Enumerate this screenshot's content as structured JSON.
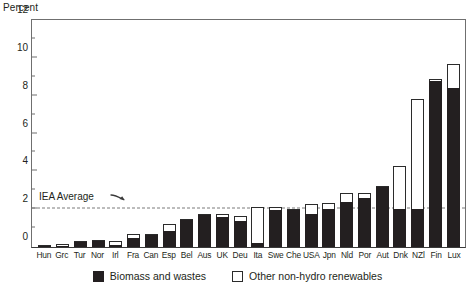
{
  "chart_data": {
    "type": "bar",
    "title": "",
    "subtitle": "",
    "ylabel": "Percent",
    "xlabel": "",
    "ylim": [
      0,
      12
    ],
    "yticks": [
      0,
      2,
      4,
      6,
      8,
      10,
      12
    ],
    "yminor": [
      1,
      3,
      5,
      7,
      9,
      11
    ],
    "grid": false,
    "stacked": true,
    "legend_position": "bottom",
    "categories": [
      "Hun",
      "Grc",
      "Tur",
      "Nor",
      "Irl",
      "Fra",
      "Can",
      "Esp",
      "Bel",
      "Aus",
      "UK",
      "Deu",
      "Ita",
      "Swe",
      "Che",
      "USA",
      "Jpn",
      "Nld",
      "Por",
      "Aut",
      "Dnk",
      "NZl",
      "Fin",
      "Lux"
    ],
    "series": [
      {
        "name": "Biomass and wastes",
        "color": "#231f20",
        "values": [
          0.05,
          0.05,
          0.25,
          0.3,
          0.1,
          0.5,
          0.65,
          0.85,
          1.45,
          1.7,
          1.6,
          1.35,
          0.2,
          1.95,
          1.95,
          1.75,
          2.0,
          2.4,
          2.6,
          3.15,
          2.0,
          2.0,
          8.8,
          8.4
        ]
      },
      {
        "name": "Other non-hydro renewables",
        "color": "#ffffff",
        "values": [
          0.05,
          0.1,
          0.05,
          0.05,
          0.2,
          0.2,
          0.05,
          0.35,
          0.05,
          0.05,
          0.15,
          0.3,
          1.9,
          0.15,
          0.05,
          0.55,
          0.35,
          0.45,
          0.25,
          0.1,
          2.3,
          5.85,
          0.1,
          1.3
        ]
      }
    ],
    "totals": [
      0.1,
      0.15,
      0.3,
      0.35,
      0.3,
      0.7,
      0.7,
      1.2,
      1.5,
      1.75,
      1.75,
      1.65,
      2.1,
      2.1,
      2.0,
      2.3,
      2.35,
      2.85,
      2.85,
      3.25,
      4.3,
      7.85,
      8.9,
      9.7
    ],
    "annotations": [
      {
        "name": "iea-average",
        "label": "IEA Average",
        "value": 2.0,
        "style": "dashed-horizontal-line"
      }
    ]
  },
  "legend": {
    "items": [
      {
        "label": "Biomass and wastes",
        "swatch": "filled-square"
      },
      {
        "label": "Other non-hydro renewables",
        "swatch": "open-square"
      }
    ]
  }
}
